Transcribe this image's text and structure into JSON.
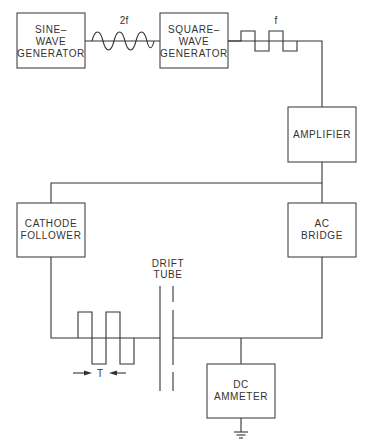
{
  "diagram": {
    "blocks": {
      "sine_generator": {
        "line1": "SINE–",
        "line2": "WAVE",
        "line3": "GENERATOR"
      },
      "square_generator": {
        "line1": "SQUARE–",
        "line2": "WAVE",
        "line3": "GENERATOR"
      },
      "amplifier": {
        "line1": "AMPLIFIER"
      },
      "cathode_follower": {
        "line1": "CATHODE",
        "line2": "FOLLOWER"
      },
      "ac_bridge": {
        "line1": "AC",
        "line2": "BRIDGE"
      },
      "dc_ammeter": {
        "line1": "DC",
        "line2": "AMMETER"
      }
    },
    "labels": {
      "sine_freq": "2f",
      "square_freq": "f",
      "drift_tube_line1": "DRIFT",
      "drift_tube_line2": "TUBE",
      "period": "T"
    },
    "colors": {
      "line": "#333333",
      "background": "#ffffff"
    }
  }
}
